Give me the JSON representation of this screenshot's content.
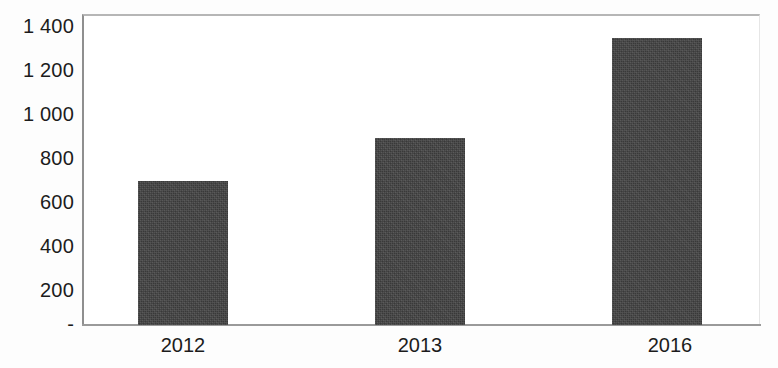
{
  "chart_data": {
    "type": "bar",
    "title": "",
    "subtitle": "",
    "xlabel": "",
    "ylabel": "",
    "categories": [
      "2012",
      "2013",
      "2016"
    ],
    "values": [
      650,
      840,
      1290
    ],
    "series": [
      {
        "name": "",
        "values": [
          650,
          840,
          1290
        ]
      }
    ],
    "ylim": [
      0,
      1400
    ],
    "ytick_values": [
      1400,
      1200,
      1000,
      800,
      600,
      400,
      200,
      0
    ],
    "ytick_labels": [
      "1 400",
      "1 200",
      "1 000",
      "800",
      "600",
      "400",
      "200",
      "-"
    ],
    "grid": false,
    "legend": false,
    "legend_position": "none",
    "bar_color": "#414141",
    "axis_color": "#9a9a9a",
    "text_color": "#1c1c1c",
    "background_color": "#ffffff",
    "annotations": []
  },
  "layout": {
    "plot": {
      "left": 82,
      "top": 14,
      "width": 678,
      "height": 311,
      "baseline_y": 325
    },
    "y_label_positions": [
      16,
      60,
      104,
      148,
      192,
      236,
      280,
      314
    ],
    "bars_geometry": [
      {
        "left": 138,
        "width": 90,
        "top": 180
      },
      {
        "left": 375,
        "width": 90,
        "top": 139
      },
      {
        "left": 612,
        "width": 90,
        "top": 39
      }
    ],
    "x_label_positions": [
      183,
      420,
      670
    ]
  }
}
